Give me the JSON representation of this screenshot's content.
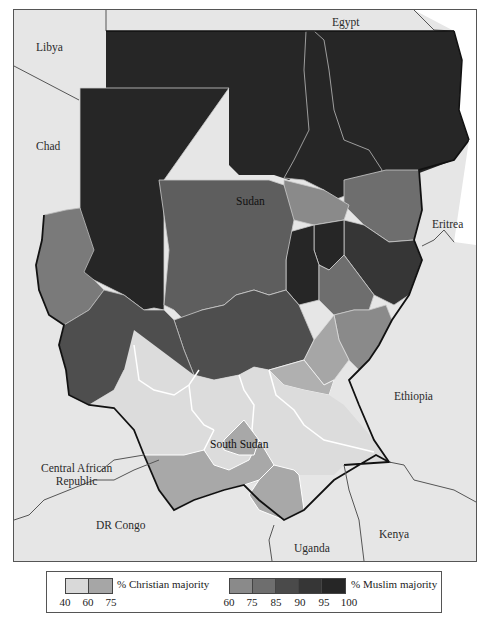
{
  "map": {
    "title": "Sudan and South Sudan religious majority by state",
    "labels": {
      "libya": "Libya",
      "egypt": "Egypt",
      "chad": "Chad",
      "sudan": "Sudan",
      "eritrea": "Eritrea",
      "ethiopia": "Ethiopia",
      "south_sudan": "South Sudan",
      "car_line1": "Central African",
      "car_line2": "Republic",
      "dr_congo": "DR Congo",
      "uganda": "Uganda",
      "kenya": "Kenya"
    },
    "colors": {
      "background": "#e6e6e6",
      "christian_40_60": "#d9d9d9",
      "christian_60_75": "#a6a6a6",
      "muslim_60_75": "#8a8a8a",
      "muslim_75_85": "#6e6e6e",
      "muslim_85_90": "#4a4a4a",
      "muslim_90_95": "#363636",
      "muslim_95_100": "#262626"
    }
  },
  "legend": {
    "christian": {
      "title": "% Christian majority",
      "ticks": [
        "40",
        "60",
        "75"
      ],
      "swatches": [
        "#d9d9d9",
        "#a6a6a6"
      ]
    },
    "muslim": {
      "title": "% Muslim majority",
      "ticks": [
        "60",
        "75",
        "85",
        "90",
        "95",
        "100"
      ],
      "swatches": [
        "#8a8a8a",
        "#6e6e6e",
        "#4a4a4a",
        "#363636",
        "#262626"
      ]
    }
  }
}
